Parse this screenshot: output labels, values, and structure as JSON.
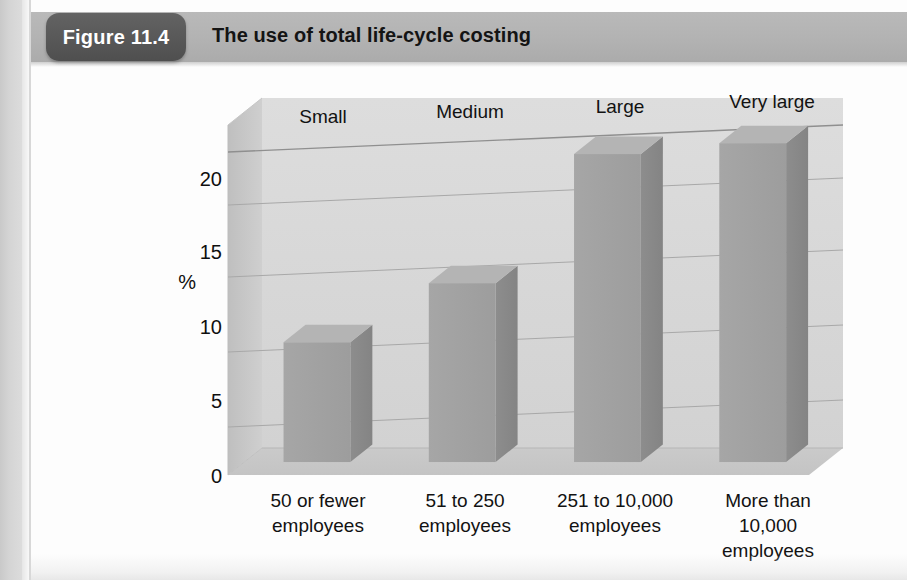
{
  "figure": {
    "badge_label": "Figure 11.4",
    "title": "The use of total life-cycle costing"
  },
  "chart_data": {
    "type": "bar",
    "title": "The use of total life-cycle costing",
    "subtitle": "",
    "xlabel": "",
    "ylabel": "%",
    "ylim": [
      0,
      22.5
    ],
    "yticks": [
      0,
      5,
      10,
      15,
      20
    ],
    "ytick_labels": [
      "0",
      "5",
      "10",
      "15",
      "20"
    ],
    "grid": true,
    "legend": "none",
    "three_d": true,
    "categories": [
      "50 or fewer employees",
      "51 to 250 employees",
      "251 to 10,000 employees",
      "More than 10,000 employees"
    ],
    "category_headers": [
      "Small",
      "Medium",
      "Large",
      "Very large"
    ],
    "category_label_lines": [
      [
        "50 or fewer",
        "employees"
      ],
      [
        "51 to 250",
        "employees"
      ],
      [
        "251 to 10,000",
        "employees"
      ],
      [
        "More than",
        "10,000",
        "employees"
      ]
    ],
    "values": [
      7.7,
      11.5,
      19.8,
      20.5
    ],
    "series": [
      {
        "name": "Use of total life-cycle costing",
        "values": [
          7.7,
          11.5,
          19.8,
          20.5
        ]
      }
    ]
  },
  "colors": {
    "badge": "#585858",
    "header_band": "#b3b3b3",
    "bar_front": "#a3a3a3",
    "bar_side": "#8a8a8a",
    "bar_top": "#9a9a9a",
    "plot_back": "#d9d9d9",
    "plot_floor": "#c9c9c9",
    "plot_wall": "#c2c2c2",
    "gridline": "#9e9e9e",
    "text": "#121212"
  }
}
